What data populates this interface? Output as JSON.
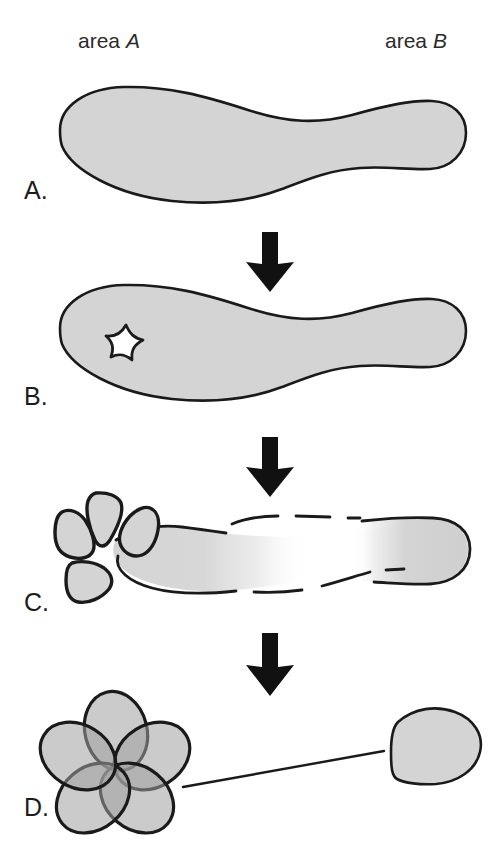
{
  "figure": {
    "width": 500,
    "height": 856,
    "background_color": "#ffffff",
    "outline_color": "#1a1a1a",
    "fill_color": "#d4d4d4",
    "fill_color_dark": "#a8a8a8",
    "fill_color_darkest": "#8a8a8a",
    "arrow_color": "#111111"
  },
  "labels": {
    "area_a_prefix": "area ",
    "area_a_italic": "A",
    "area_b_prefix": "area ",
    "area_b_italic": "B"
  },
  "panels": [
    {
      "id": "panel-a",
      "letter": "A.",
      "description": "Intact elongated organ shape, uniform gray fill with solid black outline, wide at area A end and narrowing to a club-shaped tip at area B end."
    },
    {
      "id": "panel-b",
      "letter": "B.",
      "description": "Same organ shape with a small five-pointed star-shaped white lesion in the area A region."
    },
    {
      "id": "panel-c",
      "letter": "C.",
      "description": "Four rounded triangular petal fragments separated at the area A end; the main body outline becomes dashed and the gray fill fades out toward the middle, with the area B club end still solid."
    },
    {
      "id": "panel-d",
      "letter": "D.",
      "description": "Five overlapping translucent blobs forming a rosette at the area A end, joined by a thin line to a single isolated rounded blob at the area B end."
    }
  ],
  "arrows": [
    {
      "id": "arrow-a-to-b",
      "direction": "down"
    },
    {
      "id": "arrow-b-to-c",
      "direction": "down"
    },
    {
      "id": "arrow-c-to-d",
      "direction": "down"
    }
  ]
}
